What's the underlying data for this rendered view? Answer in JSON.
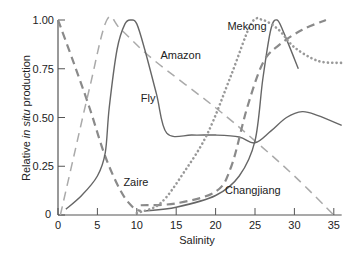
{
  "chart_data": {
    "type": "line",
    "title": "",
    "xlabel": "Salinity",
    "ylabel_parts": [
      "Relative ",
      "in situ",
      " production"
    ],
    "xlim": [
      0,
      36
    ],
    "ylim": [
      0,
      1.0
    ],
    "grid": false,
    "legend": "inline labels",
    "x_ticks": [
      0,
      5,
      10,
      15,
      20,
      25,
      30,
      35
    ],
    "x_tick_labels": [
      "0",
      "5",
      "10",
      "15",
      "20",
      "25",
      "30",
      "35"
    ],
    "y_ticks": [
      0,
      0.25,
      0.5,
      0.75,
      1.0
    ],
    "y_tick_labels": [
      "0",
      "0.25",
      "0.50",
      "0.75",
      "1.00"
    ],
    "colors": {
      "axis": "#555555",
      "solid": "#666666",
      "heavy_dash": "#8a8a8a",
      "light_dash": "#aaaaaa",
      "dotted": "#999999"
    },
    "series": [
      {
        "name": "Zaire",
        "style": "heavy-dashed",
        "points": [
          [
            0,
            1.0
          ],
          [
            2,
            0.78
          ],
          [
            4,
            0.55
          ],
          [
            6,
            0.3
          ],
          [
            8,
            0.12
          ],
          [
            9.5,
            0.04
          ],
          [
            10.5,
            0.02
          ]
        ]
      },
      {
        "name": "Amazon",
        "style": "light-dashed",
        "points": [
          [
            0.3,
            0.0
          ],
          [
            2,
            0.3
          ],
          [
            4,
            0.65
          ],
          [
            6.2,
            1.0
          ],
          [
            8,
            0.95
          ],
          [
            12,
            0.8
          ],
          [
            20,
            0.55
          ],
          [
            25,
            0.38
          ],
          [
            30,
            0.2
          ],
          [
            35,
            0.0
          ]
        ]
      },
      {
        "name": "Fly",
        "style": "solid",
        "points": [
          [
            1,
            0.03
          ],
          [
            3,
            0.1
          ],
          [
            5,
            0.2
          ],
          [
            6,
            0.32
          ],
          [
            6.5,
            0.55
          ],
          [
            7.5,
            0.85
          ],
          [
            8.5,
            0.98
          ],
          [
            9.3,
            1.0
          ],
          [
            10,
            0.98
          ],
          [
            11,
            0.85
          ],
          [
            12.5,
            0.62
          ],
          [
            13.8,
            0.42
          ],
          [
            17,
            0.41
          ],
          [
            20,
            0.41
          ],
          [
            23,
            0.4
          ],
          [
            25,
            0.37
          ],
          [
            27,
            0.43
          ],
          [
            29,
            0.5
          ],
          [
            31,
            0.53
          ],
          [
            33,
            0.51
          ],
          [
            36,
            0.46
          ]
        ]
      },
      {
        "name": "Changjiang",
        "style": "solid",
        "points": [
          [
            11,
            0.02
          ],
          [
            15,
            0.04
          ],
          [
            20,
            0.1
          ],
          [
            23,
            0.2
          ],
          [
            25,
            0.38
          ],
          [
            26,
            0.7
          ],
          [
            27,
            0.95
          ],
          [
            27.8,
            1.0
          ],
          [
            28.7,
            0.93
          ],
          [
            30.5,
            0.75
          ]
        ]
      },
      {
        "name": "Changjiang (dashed)",
        "style": "heavy-dashed",
        "points": [
          [
            10.5,
            0.05
          ],
          [
            15,
            0.06
          ],
          [
            20,
            0.12
          ],
          [
            22,
            0.25
          ],
          [
            24,
            0.55
          ],
          [
            26,
            0.78
          ],
          [
            28,
            0.87
          ],
          [
            31,
            0.95
          ],
          [
            34,
            1.0
          ]
        ]
      },
      {
        "name": "Mekong",
        "style": "dotted",
        "points": [
          [
            10,
            0.01
          ],
          [
            13,
            0.06
          ],
          [
            16,
            0.22
          ],
          [
            19,
            0.42
          ],
          [
            22,
            0.72
          ],
          [
            24.5,
            0.98
          ],
          [
            26,
            1.0
          ],
          [
            28,
            0.95
          ],
          [
            30,
            0.86
          ],
          [
            33,
            0.79
          ],
          [
            36,
            0.78
          ]
        ]
      }
    ],
    "annotations": [
      {
        "text": "Mekong",
        "x": 21.5,
        "y": 0.97
      },
      {
        "text": "Amazon",
        "x": 13,
        "y": 0.82
      },
      {
        "text": "Fly",
        "x": 10.5,
        "y": 0.6
      },
      {
        "text": "Zaire",
        "x": 8.3,
        "y": 0.17
      },
      {
        "text": "Changjiang",
        "x": 21.2,
        "y": 0.13
      }
    ]
  }
}
